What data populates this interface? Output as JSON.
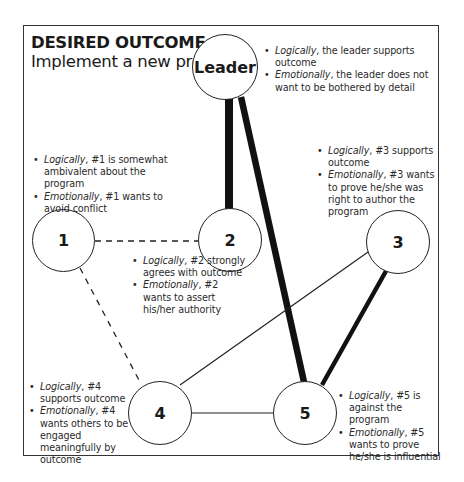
{
  "title": {
    "heading": "DESIRED OUTCOME",
    "colon": ":",
    "subtitle": "Implement a new program"
  },
  "nodes": {
    "leader": {
      "label": "Leader"
    },
    "n1": {
      "label": "1"
    },
    "n2": {
      "label": "2"
    },
    "n3": {
      "label": "3"
    },
    "n4": {
      "label": "4"
    },
    "n5": {
      "label": "5"
    }
  },
  "notes": {
    "leader": [
      {
        "key": "Logically",
        "text": ", the leader supports outcome"
      },
      {
        "key": "Emotionally",
        "text": ", the leader does not want to be bothered by detail"
      }
    ],
    "n1": [
      {
        "key": "Logically",
        "text": ", #1 is somewhat ambivalent about the program"
      },
      {
        "key": "Emotionally",
        "text": ", #1 wants to avoid conflict"
      }
    ],
    "n2": [
      {
        "key": "Logically",
        "text": ", #2 strongly agrees with outcome"
      },
      {
        "key": "Emotionally",
        "text": ", #2 wants to assert his/her authority"
      }
    ],
    "n3": [
      {
        "key": "Logically",
        "text": ", #3 supports outcome"
      },
      {
        "key": "Emotionally",
        "text": ", #3 wants to prove he/she was right to author the program"
      }
    ],
    "n4": [
      {
        "key": "Logically",
        "text": ", #4 supports outcome"
      },
      {
        "key": "Emotionally",
        "text": ", #4 wants others to be engaged meaningfully by outcome"
      }
    ],
    "n5": [
      {
        "key": "Logically",
        "text": ", #5 is against the program"
      },
      {
        "key": "Emotionally",
        "text": ", #5 wants to prove he/she is influential"
      }
    ]
  },
  "edges": [
    {
      "from": "Leader",
      "to": "2",
      "style": "thick"
    },
    {
      "from": "Leader",
      "to": "5",
      "style": "thick"
    },
    {
      "from": "3",
      "to": "5",
      "style": "thick"
    },
    {
      "from": "1",
      "to": "2",
      "style": "dashed"
    },
    {
      "from": "1",
      "to": "4",
      "style": "dashed"
    },
    {
      "from": "3",
      "to": "4",
      "style": "thin"
    },
    {
      "from": "4",
      "to": "5",
      "style": "thin"
    }
  ],
  "colors": {
    "ink": "#1a1a1a",
    "frame": "#333333",
    "background": "#ffffff"
  }
}
